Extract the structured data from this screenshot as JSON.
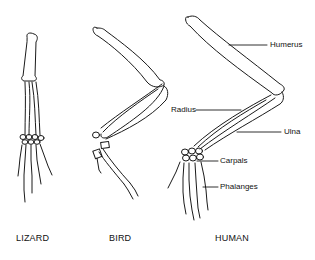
{
  "diagram": {
    "type": "homologous-forelimb-comparison",
    "specimens": [
      {
        "id": "lizard",
        "title": "LIZARD"
      },
      {
        "id": "bird",
        "title": "BIRD"
      },
      {
        "id": "human",
        "title": "HUMAN"
      }
    ],
    "labels": {
      "humerus": "Humerus",
      "radius": "Radius",
      "ulna": "Ulna",
      "carpals": "Carpals",
      "phalanges": "Phalanges"
    },
    "colors": {
      "line": "#1a1a1a",
      "background": "#ffffff"
    }
  }
}
